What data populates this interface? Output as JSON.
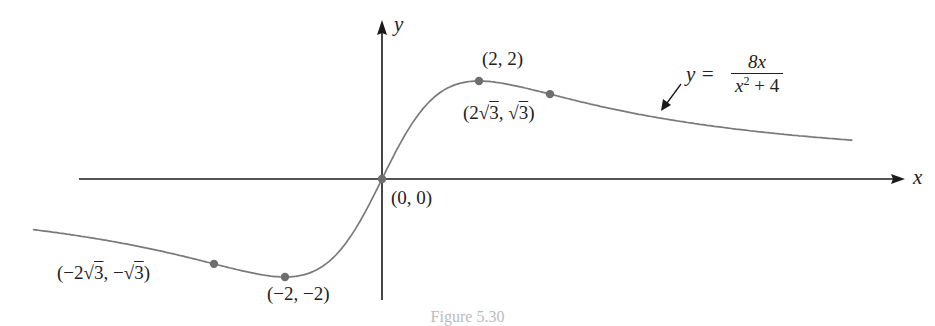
{
  "chart_data": {
    "type": "line",
    "title": "",
    "function": "y = 8x / (x^2 + 4)",
    "xlabel": "x",
    "ylabel": "y",
    "xlim": [
      -7.2,
      9.5
    ],
    "ylim": [
      -2.3,
      3.2
    ],
    "grid": false,
    "legend": null,
    "series": [
      {
        "name": "y = 8x/(x^2+4)",
        "x": [
          -7.2,
          -6,
          -5,
          -4,
          -3.464,
          -3,
          -2,
          -1,
          0,
          1,
          2,
          3,
          3.464,
          4,
          5,
          6,
          7,
          8,
          9.5
        ],
        "y": [
          -1.03,
          -1.2,
          -1.38,
          -1.6,
          -1.73,
          -1.85,
          -2.0,
          -1.6,
          0,
          1.6,
          2.0,
          1.85,
          1.73,
          1.6,
          1.38,
          1.2,
          1.06,
          0.94,
          0.81
        ]
      }
    ],
    "marked_points": [
      {
        "x": 0,
        "y": 0,
        "label": "(0, 0)"
      },
      {
        "x": 2,
        "y": 2,
        "label": "(2, 2)"
      },
      {
        "x": 3.464,
        "y": 1.732,
        "label": "(2√3, √3)"
      },
      {
        "x": -2,
        "y": -2,
        "label": "(−2, −2)"
      },
      {
        "x": -3.464,
        "y": -1.732,
        "label": "(−2√3, −√3)"
      }
    ],
    "annotations": [
      {
        "text": "y = 8x / (x² + 4)",
        "arrow_to": "curve at x≈6"
      }
    ]
  },
  "labels": {
    "x_axis": "x",
    "y_axis": "y",
    "origin": "(0, 0)",
    "max_point": "(2, 2)",
    "min_point": "(−2, −2)",
    "inflect_pos_pre": "(2",
    "inflect_pos_rad1": "3",
    "inflect_pos_mid": ", ",
    "inflect_pos_rad2": "3",
    "inflect_pos_post": ")",
    "inflect_neg_pre": "(−2",
    "inflect_neg_rad1": "3",
    "inflect_neg_mid": ", −",
    "inflect_neg_rad2": "3",
    "inflect_neg_post": ")",
    "eq_lhs": "y =",
    "eq_num": "8x",
    "eq_den_x": "x",
    "eq_den_exp": "2",
    "eq_den_rest": " + 4"
  },
  "caption": "Figure 5.30",
  "colors": {
    "axis": "#1a1a1a",
    "curve": "#7a7a7a",
    "point": "#6e6e6e",
    "text": "#222222"
  }
}
